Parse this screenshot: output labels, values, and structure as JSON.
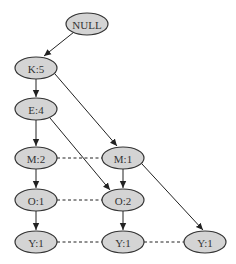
{
  "diagram": {
    "type": "fp-tree",
    "colors": {
      "node_fill": "#d4d4d4",
      "node_stroke": "#333333",
      "edge": "#222222",
      "background": "#ffffff"
    },
    "nodes": [
      {
        "id": "null",
        "label": "NULL",
        "cx": 87,
        "cy": 24,
        "rx": 21,
        "ry": 11
      },
      {
        "id": "k5",
        "label": "K:5",
        "cx": 36,
        "cy": 68,
        "rx": 21,
        "ry": 11
      },
      {
        "id": "e4",
        "label": "E:4",
        "cx": 36,
        "cy": 109,
        "rx": 21,
        "ry": 11
      },
      {
        "id": "m2",
        "label": "M:2",
        "cx": 36,
        "cy": 158,
        "rx": 21,
        "ry": 11
      },
      {
        "id": "m1",
        "label": "M:1",
        "cx": 123,
        "cy": 158,
        "rx": 21,
        "ry": 11
      },
      {
        "id": "o1",
        "label": "O:1",
        "cx": 36,
        "cy": 200,
        "rx": 21,
        "ry": 11
      },
      {
        "id": "o2",
        "label": "O:2",
        "cx": 123,
        "cy": 200,
        "rx": 21,
        "ry": 11
      },
      {
        "id": "y1a",
        "label": "Y:1",
        "cx": 36,
        "cy": 242,
        "rx": 21,
        "ry": 11
      },
      {
        "id": "y1b",
        "label": "Y:1",
        "cx": 123,
        "cy": 242,
        "rx": 21,
        "ry": 11
      },
      {
        "id": "y1c",
        "label": "Y:1",
        "cx": 205,
        "cy": 242,
        "rx": 21,
        "ry": 11
      }
    ],
    "edges": [
      {
        "from": "null",
        "to": "k5",
        "x1": 74,
        "y1": 32,
        "x2": 44,
        "y2": 56
      },
      {
        "from": "k5",
        "to": "e4",
        "x1": 36,
        "y1": 79,
        "x2": 36,
        "y2": 97
      },
      {
        "from": "k5",
        "to": "m1",
        "x1": 55,
        "y1": 74,
        "x2": 117,
        "y2": 146
      },
      {
        "from": "e4",
        "to": "m2",
        "x1": 36,
        "y1": 120,
        "x2": 36,
        "y2": 146
      },
      {
        "from": "e4",
        "to": "o2",
        "x1": 50,
        "y1": 118,
        "x2": 110,
        "y2": 190
      },
      {
        "from": "m2",
        "to": "o1",
        "x1": 36,
        "y1": 169,
        "x2": 36,
        "y2": 188
      },
      {
        "from": "m1",
        "to": "o2",
        "x1": 123,
        "y1": 169,
        "x2": 123,
        "y2": 188
      },
      {
        "from": "m1",
        "to": "y1c",
        "x1": 142,
        "y1": 164,
        "x2": 203,
        "y2": 230
      },
      {
        "from": "o1",
        "to": "y1a",
        "x1": 36,
        "y1": 211,
        "x2": 36,
        "y2": 230
      },
      {
        "from": "o2",
        "to": "y1b",
        "x1": 123,
        "y1": 211,
        "x2": 123,
        "y2": 230
      }
    ],
    "links": [
      {
        "from": "m2",
        "to": "m1",
        "x1": 57,
        "y1": 158,
        "x2": 102,
        "y2": 158
      },
      {
        "from": "o1",
        "to": "o2",
        "x1": 57,
        "y1": 200,
        "x2": 102,
        "y2": 200
      },
      {
        "from": "y1a",
        "to": "y1b",
        "x1": 57,
        "y1": 242,
        "x2": 102,
        "y2": 242
      },
      {
        "from": "y1b",
        "to": "y1c",
        "x1": 144,
        "y1": 242,
        "x2": 184,
        "y2": 242
      }
    ]
  }
}
